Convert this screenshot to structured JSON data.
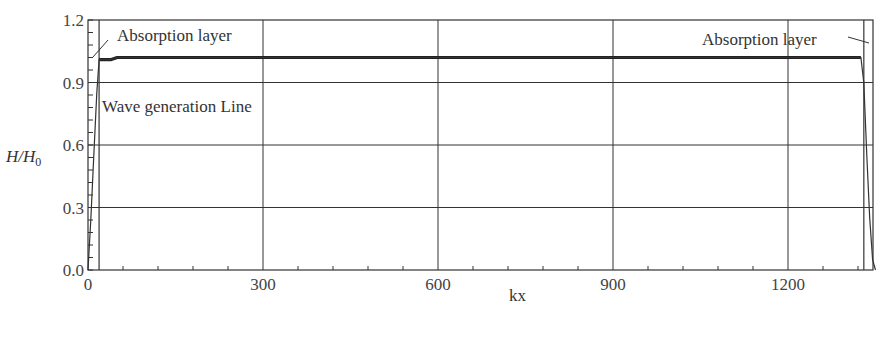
{
  "chart_data": {
    "type": "line",
    "title": "",
    "xlabel": "kx",
    "ylabel": "H/H0",
    "ylabel_display": {
      "main": "H/H",
      "sub": "0"
    },
    "xlim": [
      0,
      1350
    ],
    "ylim": [
      0.0,
      1.2
    ],
    "xticks": [
      0,
      300,
      600,
      900,
      1200
    ],
    "xtick_labels": [
      "0",
      "300",
      "600",
      "900",
      "1200"
    ],
    "yticks": [
      0.0,
      0.3,
      0.6,
      0.9,
      1.2
    ],
    "ytick_labels": [
      "0.0",
      "0.3",
      "0.6",
      "0.9",
      "1.2"
    ],
    "grid": true,
    "legend": null,
    "annotations": [
      {
        "text": "Absorption layer",
        "position": "top-left",
        "x": 50,
        "y": 1.13
      },
      {
        "text": "Wave generation Line",
        "position": "left",
        "x": 25,
        "y": 0.82
      },
      {
        "text": "Absorption layer",
        "position": "top-right",
        "x": 1180,
        "y": 1.13
      }
    ],
    "reference_lines": [
      {
        "name": "wave-generation-line",
        "orientation": "vertical",
        "x": 19
      },
      {
        "name": "right-absorption-boundary",
        "orientation": "vertical",
        "x": 1330
      }
    ],
    "series": [
      {
        "name": "H/H0",
        "x": [
          0,
          5,
          10,
          15,
          19,
          25,
          40,
          50,
          100,
          300,
          600,
          900,
          1200,
          1325,
          1330,
          1335,
          1340,
          1345,
          1350
        ],
        "y": [
          0.0,
          0.25,
          0.55,
          0.85,
          1.01,
          1.01,
          1.01,
          1.02,
          1.02,
          1.02,
          1.02,
          1.02,
          1.02,
          1.02,
          0.9,
          0.55,
          0.25,
          0.05,
          0.0
        ]
      }
    ]
  },
  "footer": {
    "caption_partial": ""
  }
}
